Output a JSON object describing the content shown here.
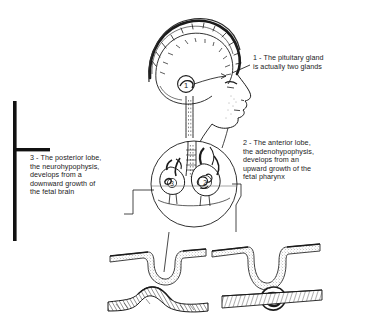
{
  "figure": {
    "background_color": "#ffffff",
    "ink_color": "#1b1b1b"
  },
  "annotations": [
    {
      "id": "1",
      "name": "pituitary-gland-callout",
      "text": "1 - The pituitary gland\nis actually two glands"
    },
    {
      "id": "2",
      "name": "anterior-lobe-callout",
      "text": "2 - The anterior lobe,\nthe adenohypophysis,\ndevelops from an\nupward growth of the\nfetal pharynx"
    },
    {
      "id": "3",
      "name": "posterior-lobe-callout",
      "text": "3 - The posterior lobe,\nthe neurohypophysis,\ndevelops from a\ndownward growth of\nthe fetal brain"
    }
  ],
  "markers": {
    "head_marker_1": "1",
    "inset_marker_2": "2",
    "inset_marker_3": "3"
  },
  "panels": {
    "head_profile": "lateral head profile with brain outline",
    "circular_inset": "magnified pituitary region with anterior and posterior lobes",
    "embryo_top_left": "neural groove invagination stage",
    "embryo_top_right": "deepened pouch stage",
    "embryo_bottom_left": "closed neural tube elevation stage",
    "embryo_bottom_right": "detached Rathke pouch vesicle stage"
  }
}
